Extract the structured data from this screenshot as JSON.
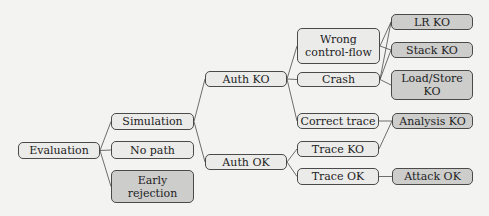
{
  "diagram": {
    "type": "tree",
    "colors": {
      "background": "#f3f3f1",
      "leaf_fill": "#ebebea",
      "outcome_fill": "#cdcdcc",
      "stroke": "#4a4a4a"
    },
    "nodes": [
      {
        "id": "evaluation",
        "label": "Evaluation",
        "style": "light",
        "x": 18,
        "y": 142,
        "w": 82,
        "h": 17
      },
      {
        "id": "simulation",
        "label": "Simulation",
        "style": "light",
        "x": 111,
        "y": 113,
        "w": 83,
        "h": 17
      },
      {
        "id": "no_path",
        "label": "No path",
        "style": "light",
        "x": 111,
        "y": 141,
        "w": 83,
        "h": 18
      },
      {
        "id": "early_rejection",
        "label": "Early rejection",
        "style": "dark",
        "x": 111,
        "y": 170,
        "w": 83,
        "h": 33
      },
      {
        "id": "auth_ko",
        "label": "Auth KO",
        "style": "light",
        "x": 205,
        "y": 71,
        "w": 82,
        "h": 16
      },
      {
        "id": "auth_ok",
        "label": "Auth OK",
        "style": "light",
        "x": 205,
        "y": 154,
        "w": 82,
        "h": 16
      },
      {
        "id": "wrong_cf",
        "label": "Wrong control-flow",
        "style": "light",
        "x": 297,
        "y": 28,
        "w": 83,
        "h": 36
      },
      {
        "id": "crash",
        "label": "Crash",
        "style": "light",
        "x": 297,
        "y": 72,
        "w": 83,
        "h": 15
      },
      {
        "id": "correct_trace",
        "label": "Correct trace",
        "style": "light",
        "x": 297,
        "y": 113,
        "w": 82,
        "h": 16
      },
      {
        "id": "trace_ko",
        "label": "Trace KO",
        "style": "light",
        "x": 297,
        "y": 141,
        "w": 82,
        "h": 16
      },
      {
        "id": "trace_ok",
        "label": "Trace OK",
        "style": "light",
        "x": 297,
        "y": 168,
        "w": 82,
        "h": 17
      },
      {
        "id": "lr_ko",
        "label": "LR KO",
        "style": "dark",
        "x": 391,
        "y": 14,
        "w": 82,
        "h": 16
      },
      {
        "id": "stack_ko",
        "label": "Stack KO",
        "style": "dark",
        "x": 391,
        "y": 42,
        "w": 82,
        "h": 16
      },
      {
        "id": "load_store_ko",
        "label": "Load/Store KO",
        "style": "dark",
        "x": 391,
        "y": 70,
        "w": 82,
        "h": 30
      },
      {
        "id": "analysis_ko",
        "label": "Analysis KO",
        "style": "dark",
        "x": 392,
        "y": 113,
        "w": 81,
        "h": 16
      },
      {
        "id": "attack_ok",
        "label": "Attack OK",
        "style": "dark",
        "x": 392,
        "y": 168,
        "w": 81,
        "h": 17
      }
    ],
    "edges": [
      [
        "evaluation",
        "simulation"
      ],
      [
        "evaluation",
        "no_path"
      ],
      [
        "evaluation",
        "early_rejection"
      ],
      [
        "simulation",
        "auth_ko"
      ],
      [
        "simulation",
        "auth_ok"
      ],
      [
        "auth_ko",
        "wrong_cf"
      ],
      [
        "auth_ko",
        "crash"
      ],
      [
        "auth_ko",
        "correct_trace"
      ],
      [
        "auth_ok",
        "trace_ko"
      ],
      [
        "auth_ok",
        "trace_ok"
      ],
      [
        "wrong_cf",
        "lr_ko"
      ],
      [
        "wrong_cf",
        "stack_ko"
      ],
      [
        "crash",
        "lr_ko"
      ],
      [
        "crash",
        "stack_ko"
      ],
      [
        "crash",
        "load_store_ko"
      ],
      [
        "correct_trace",
        "analysis_ko"
      ],
      [
        "trace_ko",
        "analysis_ko"
      ],
      [
        "trace_ok",
        "attack_ok"
      ]
    ]
  },
  "labels": {
    "evaluation": "Evaluation",
    "simulation": "Simulation",
    "no_path": "No path",
    "early_rejection_1": "Early",
    "early_rejection_2": "rejection",
    "auth_ko": "Auth KO",
    "auth_ok": "Auth OK",
    "wrong_cf_1": "Wrong",
    "wrong_cf_2": "control-flow",
    "crash": "Crash",
    "correct_trace": "Correct trace",
    "trace_ko": "Trace KO",
    "trace_ok": "Trace OK",
    "lr_ko": "LR KO",
    "stack_ko": "Stack KO",
    "load_store_ko_1": "Load/Store",
    "load_store_ko_2": "KO",
    "analysis_ko": "Analysis KO",
    "attack_ok": "Attack OK"
  }
}
